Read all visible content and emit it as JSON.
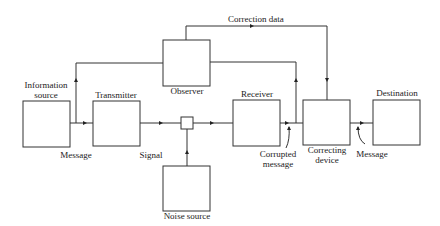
{
  "diagram": {
    "colors": {
      "line": "#333333",
      "text": "#222222",
      "background": "#ffffff"
    },
    "blocks": {
      "information_source": {
        "label_line1": "Information",
        "label_line2": "source"
      },
      "transmitter": {
        "label": "Transmitter"
      },
      "observer": {
        "label": "Observer"
      },
      "noise_source": {
        "label": "Noise source"
      },
      "receiver": {
        "label": "Receiver"
      },
      "correcting_device": {
        "label_line1": "Correcting",
        "label_line2": "device"
      },
      "destination": {
        "label": "Destination"
      }
    },
    "junction": {
      "name": "summing-junction"
    },
    "edge_labels": {
      "message_in": "Message",
      "signal": "Signal",
      "corrupted_line1": "Corrupted",
      "corrupted_line2": "message",
      "message_out": "Message",
      "correction_data": "Correction data"
    },
    "edges": [
      {
        "from": "Information source",
        "to": "Transmitter",
        "label": "Message"
      },
      {
        "from": "Information source",
        "to": "Observer",
        "label": ""
      },
      {
        "from": "Transmitter",
        "to": "Summing junction",
        "label": "Signal"
      },
      {
        "from": "Noise source",
        "to": "Summing junction",
        "label": ""
      },
      {
        "from": "Summing junction",
        "to": "Receiver",
        "label": ""
      },
      {
        "from": "Receiver",
        "to": "Correcting device",
        "label": "Corrupted message"
      },
      {
        "from": "Receiver",
        "to": "Observer",
        "label": ""
      },
      {
        "from": "Observer",
        "to": "Correcting device",
        "label": "Correction data"
      },
      {
        "from": "Correcting device",
        "to": "Destination",
        "label": "Message"
      }
    ]
  }
}
